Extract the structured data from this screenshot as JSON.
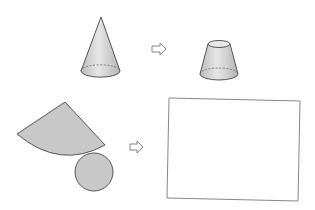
{
  "diagram": {
    "description": "Cone cut into a frustum; net of cone (sector + circle) to be transformed into the frustum net drawn in the empty box",
    "colors": {
      "background": "#ffffff",
      "fill_solid": "#d4d4d4",
      "fill_net": "#c8c8c8",
      "stroke": "#555555",
      "arrow_stroke": "#777777",
      "box_stroke": "#888888"
    },
    "row_top": {
      "left_shape": "cone",
      "arrow": "hollow-right-arrow",
      "right_shape": "frustum"
    },
    "row_bottom": {
      "left_shape": "cone-net-sector-and-circle",
      "arrow": "hollow-right-arrow",
      "right_shape": "empty-answer-box"
    }
  }
}
